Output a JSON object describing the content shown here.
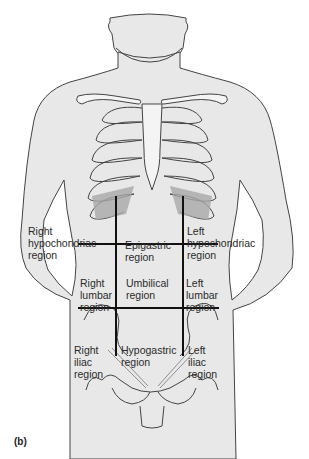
{
  "figure": {
    "caption": "(b)",
    "colors": {
      "skin_fill": "#e8e8e8",
      "outline": "#444444",
      "rib_shade": "#a8a8a8",
      "grid_line": "#111111",
      "text": "#2a2a2a"
    }
  },
  "regions": [
    {
      "id": "right-hypochondriac",
      "lines": [
        "Right",
        "hypochondriac",
        "region"
      ]
    },
    {
      "id": "epigastric",
      "lines": [
        "Epigastric",
        "region"
      ]
    },
    {
      "id": "left-hypochondriac",
      "lines": [
        "Left",
        "hypochondriac",
        "region"
      ]
    },
    {
      "id": "right-lumbar",
      "lines": [
        "Right",
        "lumbar",
        "region"
      ]
    },
    {
      "id": "umbilical",
      "lines": [
        "Umbilical",
        "region"
      ]
    },
    {
      "id": "left-lumbar",
      "lines": [
        "Left",
        "lumbar",
        "region"
      ]
    },
    {
      "id": "right-iliac",
      "lines": [
        "Right",
        "iliac",
        "region"
      ]
    },
    {
      "id": "hypogastric",
      "lines": [
        "Hypogastric",
        "region"
      ]
    },
    {
      "id": "left-iliac",
      "lines": [
        "Left",
        "iliac",
        "region"
      ]
    }
  ]
}
